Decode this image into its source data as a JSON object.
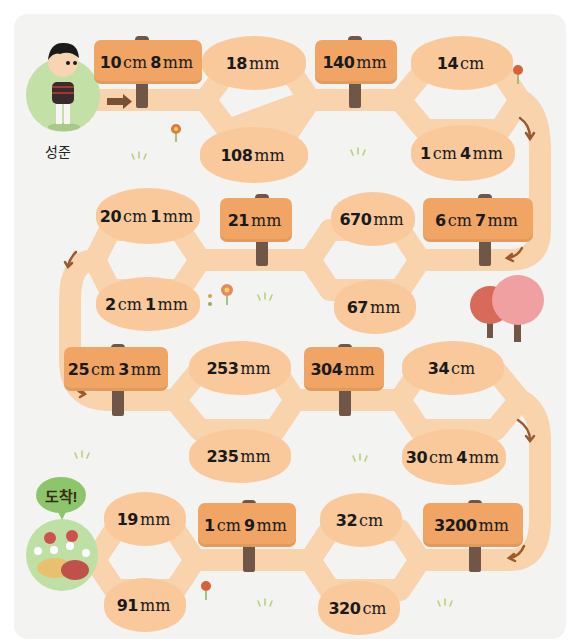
{
  "start": {
    "character_name": "성준"
  },
  "goal": {
    "label": "도착!"
  },
  "colors": {
    "path": "#f8d3ac",
    "oval": "#f9c99b",
    "sign": "#f0a565",
    "post": "#6f5646",
    "arrow": "#9b5a2c",
    "character_circle": "#c3e0a6",
    "goal_bubble": "#8cc56b"
  },
  "rows": [
    {
      "direction": "left-to-right",
      "sign1": {
        "num1": "10",
        "unit1": "cm",
        "num2": "8",
        "unit2": "mm"
      },
      "fork1": {
        "top": {
          "num": "18",
          "unit": "mm"
        },
        "bottom": {
          "num": "108",
          "unit": "mm"
        }
      },
      "sign2": {
        "num1": "140",
        "unit1": "mm"
      },
      "fork2": {
        "top": {
          "num": "14",
          "unit": "cm"
        },
        "bottom": {
          "num": "1",
          "unit": "cm",
          "num2": "4",
          "unit2": "mm"
        }
      }
    },
    {
      "direction": "right-to-left",
      "sign1": {
        "num1": "6",
        "unit1": "cm",
        "num2": "7",
        "unit2": "mm"
      },
      "fork1": {
        "top": {
          "num": "670",
          "unit": "mm"
        },
        "bottom": {
          "num": "67",
          "unit": "mm"
        }
      },
      "sign2": {
        "num1": "21",
        "unit1": "mm"
      },
      "fork2": {
        "top": {
          "num": "20",
          "unit": "cm",
          "num2": "1",
          "unit2": "mm"
        },
        "bottom": {
          "num": "2",
          "unit": "cm",
          "num2": "1",
          "unit2": "mm"
        }
      }
    },
    {
      "direction": "left-to-right",
      "sign1": {
        "num1": "25",
        "unit1": "cm",
        "num2": "3",
        "unit2": "mm"
      },
      "fork1": {
        "top": {
          "num": "253",
          "unit": "mm"
        },
        "bottom": {
          "num": "235",
          "unit": "mm"
        }
      },
      "sign2": {
        "num1": "304",
        "unit1": "mm"
      },
      "fork2": {
        "top": {
          "num": "34",
          "unit": "cm"
        },
        "bottom": {
          "num": "30",
          "unit": "cm",
          "num2": "4",
          "unit2": "mm"
        }
      }
    },
    {
      "direction": "right-to-left",
      "sign1": {
        "num1": "3200",
        "unit1": "mm"
      },
      "fork1": {
        "top": {
          "num": "32",
          "unit": "cm"
        },
        "bottom": {
          "num": "320",
          "unit": "cm"
        }
      },
      "sign2": {
        "num1": "1",
        "unit1": "cm",
        "num2": "9",
        "unit2": "mm"
      },
      "fork2": {
        "top": {
          "num": "19",
          "unit": "mm"
        },
        "bottom": {
          "num": "91",
          "unit": "mm"
        }
      }
    }
  ]
}
